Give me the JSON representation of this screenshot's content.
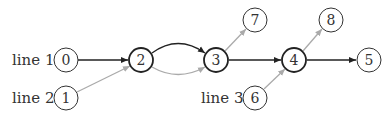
{
  "line_labels": [
    {
      "id": "line1",
      "text": "line 1"
    },
    {
      "id": "line2",
      "text": "line 2"
    },
    {
      "id": "line3",
      "text": "line 3"
    }
  ],
  "nodes": [
    {
      "id": "0",
      "label": "0",
      "bold": false
    },
    {
      "id": "1",
      "label": "1",
      "bold": false
    },
    {
      "id": "2",
      "label": "2",
      "bold": true
    },
    {
      "id": "3",
      "label": "3",
      "bold": true
    },
    {
      "id": "4",
      "label": "4",
      "bold": true
    },
    {
      "id": "5",
      "label": "5",
      "bold": false
    },
    {
      "id": "6",
      "label": "6",
      "bold": false
    },
    {
      "id": "7",
      "label": "7",
      "bold": false
    },
    {
      "id": "8",
      "label": "8",
      "bold": false
    }
  ],
  "edges": [
    {
      "from": "0",
      "to": "2",
      "color": "#222222"
    },
    {
      "from": "1",
      "to": "2",
      "color": "#aaaaaa"
    },
    {
      "from": "2",
      "to": "3",
      "color": "#222222",
      "curve": "up"
    },
    {
      "from": "2",
      "to": "3",
      "color": "#aaaaaa",
      "curve": "down"
    },
    {
      "from": "3",
      "to": "7",
      "color": "#aaaaaa"
    },
    {
      "from": "3",
      "to": "4",
      "color": "#222222"
    },
    {
      "from": "6",
      "to": "4",
      "color": "#aaaaaa"
    },
    {
      "from": "4",
      "to": "8",
      "color": "#aaaaaa"
    },
    {
      "from": "4",
      "to": "5",
      "color": "#222222"
    }
  ],
  "colors": {
    "dark_edge": "#222222",
    "light_edge": "#aaaaaa",
    "node_stroke": "#333333"
  }
}
